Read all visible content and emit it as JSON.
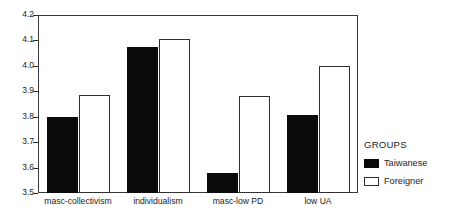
{
  "chart_data": {
    "type": "bar",
    "title": "",
    "xlabel": "",
    "ylabel": "",
    "ylim": [
      3.5,
      4.2
    ],
    "ytick_labels": [
      "4.2",
      "4.1",
      "4.0",
      "3.9",
      "3.8",
      "3.7",
      "3.6",
      "3.5"
    ],
    "ytick_values": [
      4.2,
      4.1,
      4.0,
      3.9,
      3.8,
      3.7,
      3.6,
      3.5
    ],
    "grid": false,
    "legend_position": "right",
    "legend_title": "GROUPS",
    "categories": [
      "masc-collectivism",
      "individualism",
      "masc-low PD",
      "low UA"
    ],
    "series": [
      {
        "name": "Taiwanese",
        "color": "#0b0b0b",
        "values": [
          3.8,
          4.075,
          3.58,
          3.805
        ]
      },
      {
        "name": "Foreigner",
        "color": "#ffffff",
        "values": [
          3.885,
          4.105,
          3.88,
          4.0
        ]
      }
    ]
  }
}
